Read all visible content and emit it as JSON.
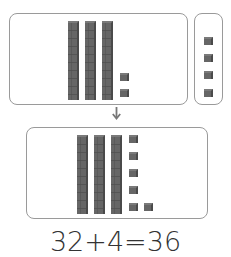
{
  "diagram": {
    "top_left_panel": {
      "tens_rods": 3,
      "ones_cubes": 2,
      "value": 32
    },
    "top_right_panel": {
      "tens_rods": 0,
      "ones_cubes": 4,
      "value": 4
    },
    "arrow": "down-arrow",
    "bottom_panel": {
      "tens_rods": 3,
      "ones_cubes": 6,
      "value": 36
    },
    "equation": "32+4=36"
  },
  "colors": {
    "block_fill": "#666666",
    "panel_border": "#9a9a9a",
    "text": "#333333"
  }
}
